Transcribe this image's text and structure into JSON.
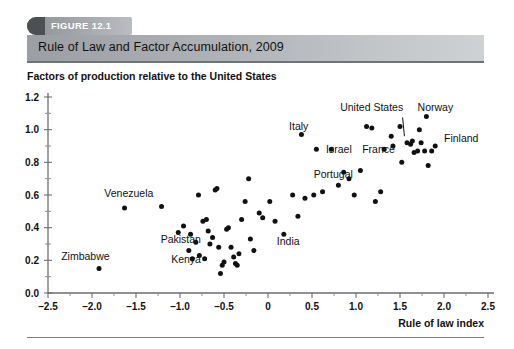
{
  "figure": {
    "tab_label": "FIGURE 12.1",
    "title": "Rule of Law and Factor Accumulation, 2009",
    "y_caption": "Factors of production relative to the United States",
    "x_axis_title": "Rule of law index"
  },
  "chart_data": {
    "type": "scatter",
    "title": "Rule of Law and Factor Accumulation, 2009",
    "xlabel": "Rule of law index",
    "ylabel": "Factors of production relative to the United States",
    "xlim": [
      -2.5,
      2.5
    ],
    "ylim": [
      0.0,
      1.2
    ],
    "xticks": [
      "-2.5",
      "-2.0",
      "-1.5",
      "-1.0",
      "-0.5",
      "0",
      "0.5",
      "1.0",
      "1.5",
      "2.0",
      "2.5"
    ],
    "xtick_values": [
      -2.5,
      -2.0,
      -1.5,
      -1.0,
      -0.5,
      0,
      0.5,
      1.0,
      1.5,
      2.0,
      2.5
    ],
    "yticks": [
      "0.0",
      "0.2",
      "0.4",
      "0.6",
      "0.8",
      "1.0",
      "1.2"
    ],
    "ytick_values": [
      0.0,
      0.2,
      0.4,
      0.6,
      0.8,
      1.0,
      1.2
    ],
    "minor_tick_step_x": 0.25,
    "minor_tick_step_y": 0.1,
    "grid": false,
    "legend": null,
    "points": [
      {
        "x": -1.92,
        "y": 0.15
      },
      {
        "x": -1.63,
        "y": 0.52
      },
      {
        "x": -1.21,
        "y": 0.53
      },
      {
        "x": -1.02,
        "y": 0.37
      },
      {
        "x": -0.96,
        "y": 0.41
      },
      {
        "x": -0.9,
        "y": 0.26
      },
      {
        "x": -0.88,
        "y": 0.36
      },
      {
        "x": -0.86,
        "y": 0.21
      },
      {
        "x": -0.82,
        "y": 0.31
      },
      {
        "x": -0.79,
        "y": 0.6
      },
      {
        "x": -0.78,
        "y": 0.23
      },
      {
        "x": -0.74,
        "y": 0.44
      },
      {
        "x": -0.72,
        "y": 0.21
      },
      {
        "x": -0.7,
        "y": 0.45
      },
      {
        "x": -0.68,
        "y": 0.38
      },
      {
        "x": -0.66,
        "y": 0.3
      },
      {
        "x": -0.63,
        "y": 0.34
      },
      {
        "x": -0.6,
        "y": 0.63
      },
      {
        "x": -0.58,
        "y": 0.64
      },
      {
        "x": -0.56,
        "y": 0.28
      },
      {
        "x": -0.54,
        "y": 0.12
      },
      {
        "x": -0.52,
        "y": 0.17
      },
      {
        "x": -0.5,
        "y": 0.19
      },
      {
        "x": -0.47,
        "y": 0.39
      },
      {
        "x": -0.45,
        "y": 0.4
      },
      {
        "x": -0.42,
        "y": 0.28
      },
      {
        "x": -0.39,
        "y": 0.22
      },
      {
        "x": -0.37,
        "y": 0.18
      },
      {
        "x": -0.35,
        "y": 0.17
      },
      {
        "x": -0.33,
        "y": 0.24
      },
      {
        "x": -0.3,
        "y": 0.45
      },
      {
        "x": -0.26,
        "y": 0.56
      },
      {
        "x": -0.22,
        "y": 0.7
      },
      {
        "x": -0.2,
        "y": 0.33
      },
      {
        "x": -0.16,
        "y": 0.26
      },
      {
        "x": -0.1,
        "y": 0.49
      },
      {
        "x": -0.06,
        "y": 0.46
      },
      {
        "x": 0.02,
        "y": 0.56
      },
      {
        "x": 0.08,
        "y": 0.44
      },
      {
        "x": 0.18,
        "y": 0.36
      },
      {
        "x": 0.28,
        "y": 0.6
      },
      {
        "x": 0.34,
        "y": 0.47
      },
      {
        "x": 0.38,
        "y": 0.97
      },
      {
        "x": 0.42,
        "y": 0.58
      },
      {
        "x": 0.52,
        "y": 0.6
      },
      {
        "x": 0.55,
        "y": 0.88
      },
      {
        "x": 0.62,
        "y": 0.62
      },
      {
        "x": 0.72,
        "y": 0.88
      },
      {
        "x": 0.8,
        "y": 0.66
      },
      {
        "x": 0.86,
        "y": 0.74
      },
      {
        "x": 0.92,
        "y": 0.7
      },
      {
        "x": 0.98,
        "y": 0.6
      },
      {
        "x": 1.05,
        "y": 0.75
      },
      {
        "x": 1.12,
        "y": 1.02
      },
      {
        "x": 1.18,
        "y": 1.01
      },
      {
        "x": 1.22,
        "y": 0.56
      },
      {
        "x": 1.28,
        "y": 0.62
      },
      {
        "x": 1.32,
        "y": 0.88
      },
      {
        "x": 1.4,
        "y": 0.96
      },
      {
        "x": 1.42,
        "y": 0.9
      },
      {
        "x": 1.5,
        "y": 1.02
      },
      {
        "x": 1.52,
        "y": 0.8
      },
      {
        "x": 1.58,
        "y": 0.92
      },
      {
        "x": 1.62,
        "y": 0.91
      },
      {
        "x": 1.64,
        "y": 0.93
      },
      {
        "x": 1.66,
        "y": 0.86
      },
      {
        "x": 1.7,
        "y": 0.87
      },
      {
        "x": 1.72,
        "y": 1.0
      },
      {
        "x": 1.74,
        "y": 0.92
      },
      {
        "x": 1.78,
        "y": 0.87
      },
      {
        "x": 1.8,
        "y": 1.08
      },
      {
        "x": 1.82,
        "y": 0.78
      },
      {
        "x": 1.86,
        "y": 0.87
      },
      {
        "x": 1.9,
        "y": 0.9
      }
    ],
    "annotations": [
      {
        "label": "Venezuela",
        "x": -1.86,
        "y": 0.585,
        "anchor": "start"
      },
      {
        "label": "Zimbabwe",
        "x": -2.35,
        "y": 0.205,
        "anchor": "start"
      },
      {
        "label": "Pakistan",
        "x": -1.22,
        "y": 0.305,
        "anchor": "start"
      },
      {
        "label": "Kenya",
        "x": -1.1,
        "y": 0.185,
        "anchor": "start"
      },
      {
        "label": "India",
        "x": 0.1,
        "y": 0.295,
        "anchor": "start"
      },
      {
        "label": "Italy",
        "x": 0.24,
        "y": 1.0,
        "anchor": "start"
      },
      {
        "label": "Israel",
        "x": 0.66,
        "y": 0.855,
        "anchor": "start"
      },
      {
        "label": "Portugal",
        "x": 0.52,
        "y": 0.705,
        "anchor": "start"
      },
      {
        "label": "France",
        "x": 1.07,
        "y": 0.855,
        "anchor": "start"
      },
      {
        "label": "United States",
        "x": 0.82,
        "y": 1.115,
        "anchor": "start"
      },
      {
        "label": "Norway",
        "x": 1.7,
        "y": 1.115,
        "anchor": "start"
      },
      {
        "label": "Finland",
        "x": 2.0,
        "y": 0.925,
        "anchor": "start"
      }
    ],
    "leader_lines": [
      {
        "from_x": 1.53,
        "from_y": 1.075,
        "to_x": 1.55,
        "to_y": 0.96
      }
    ]
  }
}
